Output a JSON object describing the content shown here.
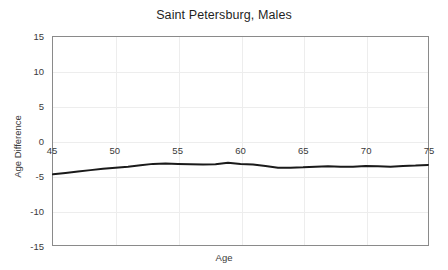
{
  "chart_data": {
    "type": "line",
    "title": "Saint Petersburg, Males",
    "xlabel": "Age",
    "ylabel": "Age Difference",
    "xlim": [
      45,
      75
    ],
    "ylim": [
      -15,
      15
    ],
    "grid": true,
    "legend": "none",
    "xticks": [
      45,
      50,
      55,
      60,
      65,
      70,
      75
    ],
    "yticks": [
      15,
      10,
      5,
      0,
      -5,
      -10,
      -15
    ],
    "xtick_labels": [
      "45",
      "50",
      "55",
      "60",
      "65",
      "70",
      "75"
    ],
    "ytick_labels": [
      "15",
      "10",
      "5",
      "0",
      "-5",
      "-10",
      "-15"
    ],
    "series": [
      {
        "name": "Age Difference",
        "color": "#1a1a1a",
        "x": [
          45,
          46,
          47,
          48,
          49,
          50,
          51,
          52,
          53,
          54,
          55,
          56,
          57,
          58,
          59,
          60,
          61,
          62,
          63,
          64,
          65,
          66,
          67,
          68,
          69,
          70,
          71,
          72,
          73,
          74,
          75
        ],
        "y": [
          -4.8,
          -4.6,
          -4.4,
          -4.2,
          -4.0,
          -3.85,
          -3.7,
          -3.5,
          -3.3,
          -3.25,
          -3.3,
          -3.35,
          -3.4,
          -3.35,
          -3.15,
          -3.3,
          -3.4,
          -3.6,
          -3.85,
          -3.85,
          -3.8,
          -3.7,
          -3.65,
          -3.7,
          -3.7,
          -3.6,
          -3.65,
          -3.7,
          -3.6,
          -3.55,
          -3.45
        ]
      }
    ]
  }
}
